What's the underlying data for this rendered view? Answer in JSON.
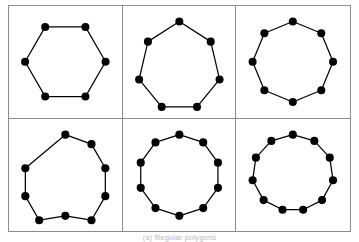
{
  "figure": {
    "caption": "(a) Regular polygons",
    "background_color": "#ffffff",
    "border_color": "#8c8c8c",
    "edge_color": "#000000",
    "vertex_color": "#000000"
  },
  "chart_data": {
    "type": "scatter",
    "title": "(a) Regular polygons",
    "xlabel": "",
    "ylabel": "",
    "layout": {
      "rows": 2,
      "columns": 3,
      "grid": true,
      "legend": "none",
      "axis_ticks": false,
      "panel_border": true
    },
    "panels": [
      {
        "index": 0,
        "position": "top-left",
        "name": "hexagon",
        "vertices": 6,
        "edges": 6,
        "rotation_degrees": 0,
        "orientation": "flat-top",
        "radius": 0.82,
        "points_normalized": [
          [
            0.91,
            0.5
          ],
          [
            0.705,
            0.855
          ],
          [
            0.295,
            0.855
          ],
          [
            0.09,
            0.5
          ],
          [
            0.295,
            0.145
          ],
          [
            0.705,
            0.145
          ]
        ]
      },
      {
        "index": 1,
        "position": "top-center",
        "name": "heptagon",
        "vertices": 7,
        "edges": 7,
        "rotation_degrees": 90,
        "orientation": "vertex-top",
        "radius": 0.82,
        "points_normalized": [
          [
            0.5,
            0.91
          ],
          [
            0.82,
            0.705
          ],
          [
            0.91,
            0.32
          ],
          [
            0.68,
            0.04
          ],
          [
            0.32,
            0.04
          ],
          [
            0.09,
            0.32
          ],
          [
            0.18,
            0.705
          ]
        ]
      },
      {
        "index": 2,
        "position": "top-right",
        "name": "octagon",
        "vertices": 8,
        "edges": 8,
        "rotation_degrees": 90,
        "orientation": "vertex-top",
        "radius": 0.82,
        "points_normalized": [
          [
            0.5,
            0.91
          ],
          [
            0.79,
            0.79
          ],
          [
            0.91,
            0.5
          ],
          [
            0.79,
            0.21
          ],
          [
            0.5,
            0.09
          ],
          [
            0.21,
            0.21
          ],
          [
            0.09,
            0.5
          ],
          [
            0.21,
            0.79
          ]
        ]
      },
      {
        "index": 3,
        "position": "bottom-left",
        "name": "nonagon",
        "vertices": 9,
        "edges": 9,
        "rotation_degrees": 90,
        "orientation": "vertex-top",
        "radius": 0.82,
        "points_normalized": [
          [
            0.5,
            0.91
          ],
          [
            0.764,
            0.814
          ],
          [
            0.904,
            0.571
          ],
          [
            0.904,
            0.289
          ],
          [
            0.764,
            0.046
          ],
          [
            0.5,
            0.09
          ],
          [
            0.236,
            0.046
          ],
          [
            0.096,
            0.289
          ],
          [
            0.096,
            0.571
          ]
        ]
      },
      {
        "index": 4,
        "position": "bottom-center",
        "name": "decagon",
        "vertices": 10,
        "edges": 10,
        "rotation_degrees": 90,
        "orientation": "vertex-top",
        "radius": 0.82,
        "points_normalized": [
          [
            0.5,
            0.91
          ],
          [
            0.741,
            0.832
          ],
          [
            0.89,
            0.627
          ],
          [
            0.89,
            0.373
          ],
          [
            0.741,
            0.168
          ],
          [
            0.5,
            0.09
          ],
          [
            0.259,
            0.168
          ],
          [
            0.11,
            0.373
          ],
          [
            0.11,
            0.627
          ],
          [
            0.259,
            0.832
          ]
        ]
      },
      {
        "index": 5,
        "position": "bottom-right",
        "name": "hendecagon",
        "vertices": 11,
        "edges": 11,
        "rotation_degrees": 90,
        "orientation": "vertex-top",
        "radius": 0.82,
        "points_normalized": [
          [
            0.5,
            0.91
          ],
          [
            0.717,
            0.847
          ],
          [
            0.873,
            0.678
          ],
          [
            0.906,
            0.45
          ],
          [
            0.795,
            0.249
          ],
          [
            0.604,
            0.152
          ],
          [
            0.396,
            0.152
          ],
          [
            0.205,
            0.249
          ],
          [
            0.094,
            0.45
          ],
          [
            0.127,
            0.678
          ],
          [
            0.283,
            0.847
          ]
        ]
      }
    ]
  }
}
